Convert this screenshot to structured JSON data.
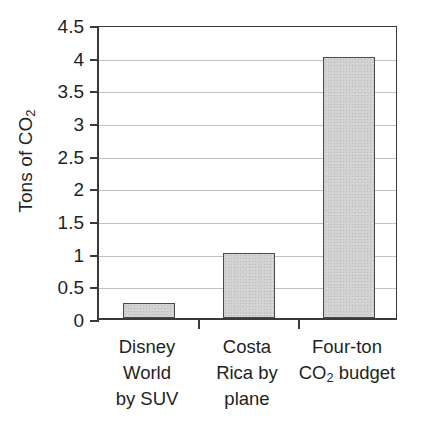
{
  "chart_data": {
    "type": "bar",
    "title": "",
    "xlabel": "",
    "ylabel": "Tons of CO2",
    "ylabel_parts": {
      "prefix": "Tons of CO",
      "subscript": "2"
    },
    "categories": [
      "Disney World by SUV",
      "Costa Rica by plane",
      "Four-ton CO2 budget"
    ],
    "category_lines": [
      [
        "Disney",
        "World",
        "by SUV"
      ],
      [
        "Costa",
        "Rica by",
        "plane"
      ],
      [
        "Four-ton",
        "CO2 budget"
      ]
    ],
    "values": [
      0.23,
      1.0,
      4.0
    ],
    "ylim": [
      0,
      4.5
    ],
    "ytick_values": [
      0,
      0.5,
      1,
      1.5,
      2,
      2.5,
      3,
      3.5,
      4,
      4.5
    ],
    "ytick_labels": [
      "0",
      "0.5",
      "1",
      "1.5",
      "2",
      "2.5",
      "3",
      "3.5",
      "4",
      "4.5"
    ],
    "grid": true,
    "legend": false,
    "legend_position": "none",
    "colors": {
      "bar_fill": "#d2d2d2",
      "bar_edge": "#4a4a4a",
      "axis": "#3a3a3a",
      "grid": "#a9a9a9",
      "text": "#231f20",
      "background": "#ffffff"
    }
  }
}
